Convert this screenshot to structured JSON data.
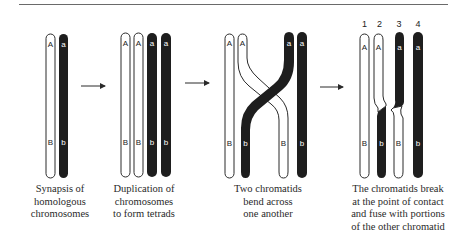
{
  "colors": {
    "dark": "#1e1e1e",
    "light": "#ffffff",
    "outline": "#2a2a2a",
    "rule": "#6a6a6a"
  },
  "panels": [
    {
      "id": "synapsis",
      "caption_lines": [
        "Synapsis of",
        "homologous",
        "chromosomes"
      ],
      "chromatids": [
        {
          "color": "light",
          "top_label": "A",
          "bottom_label": "B"
        },
        {
          "color": "dark",
          "top_label": "a",
          "bottom_label": "b"
        }
      ]
    },
    {
      "id": "duplication",
      "caption_lines": [
        "Duplication of",
        "chromosomes",
        "to form tetrads"
      ],
      "chromatids": [
        {
          "color": "light",
          "top_label": "A",
          "bottom_label": "B"
        },
        {
          "color": "light",
          "top_label": "A",
          "bottom_label": "B"
        },
        {
          "color": "dark",
          "top_label": "a",
          "bottom_label": "b"
        },
        {
          "color": "dark",
          "top_label": "a",
          "bottom_label": "b"
        }
      ]
    },
    {
      "id": "bending",
      "caption_lines": [
        "Two chromatids",
        "bend across",
        "one another"
      ],
      "chromatids": [
        {
          "color": "light",
          "top_label": "A",
          "bottom_label": "B"
        },
        {
          "color": "light",
          "top_label": "A",
          "bottom_label": "B",
          "note": "crosses right"
        },
        {
          "color": "dark",
          "top_label": "a",
          "bottom_label": "b",
          "note": "crosses left"
        },
        {
          "color": "dark",
          "top_label": "a",
          "bottom_label": "b"
        }
      ]
    },
    {
      "id": "crossover",
      "caption_lines": [
        "The chromatids break",
        "at the point of contact",
        "and fuse with portions",
        "of the other chromatid"
      ],
      "numbers": [
        "1",
        "2",
        "3",
        "4"
      ],
      "chromatids": [
        {
          "number": "1",
          "top_color": "light",
          "bottom_color": "light",
          "top_label": "A",
          "bottom_label": "B"
        },
        {
          "number": "2",
          "top_color": "light",
          "bottom_color": "dark",
          "top_label": "A",
          "bottom_label": "b"
        },
        {
          "number": "3",
          "top_color": "dark",
          "bottom_color": "light",
          "top_label": "a",
          "bottom_label": "B"
        },
        {
          "number": "4",
          "top_color": "dark",
          "bottom_color": "dark",
          "top_label": "a",
          "bottom_label": "b"
        }
      ]
    }
  ],
  "arrows": [
    "arrow-1-to-2",
    "arrow-2-to-3",
    "arrow-3-to-4"
  ]
}
